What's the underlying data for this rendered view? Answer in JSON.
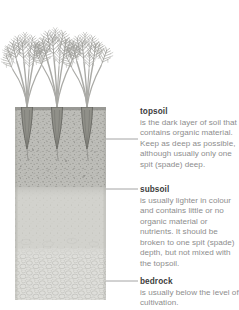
{
  "figure": {
    "plants": {
      "name": "carrot-plants",
      "count": 3,
      "root_positions": [
        27,
        57,
        87
      ]
    },
    "colors": {
      "topsoil": "#b9b9b5",
      "subsoil": "#cfcfca",
      "bedrock": "#dcdcd8",
      "outline": "#8b8b86",
      "foliage": "#9a9a96",
      "stem": "#a8a8a4",
      "root": "#6f6f6b",
      "leader_line": "#9a9a9a",
      "heading_text": "#3d3d3d",
      "body_text": "#8d8d8d",
      "background": "#ffffff"
    },
    "column": {
      "left": 15,
      "right": 106,
      "top": 107,
      "bottom": 300,
      "layers": [
        {
          "name": "topsoil",
          "top": 107,
          "bottom": 185
        },
        {
          "name": "subsoil",
          "top": 185,
          "bottom": 246
        },
        {
          "name": "bedrock",
          "top": 246,
          "bottom": 300
        }
      ]
    }
  },
  "annotations": [
    {
      "id": "topsoil",
      "title": "topsoil",
      "body": "is the dark layer of soil that contains organic material. Keep as deep as possible, although usually only one spit (spade) deep.",
      "leader": {
        "x1": 106,
        "x2": 138,
        "y": 139
      }
    },
    {
      "id": "subsoil",
      "title": "subsoil",
      "body": "is usually lighter in colour and contains little or no organic material or nutrients. It should be broken to one spit (spade) depth, but not mixed with the topsoil.",
      "leader": {
        "x1": 106,
        "x2": 138,
        "y": 189
      }
    },
    {
      "id": "bedrock",
      "title": "bedrock",
      "body": "is usually below the level of cultivation.",
      "leader": {
        "x1": 106,
        "x2": 138,
        "y": 281
      }
    }
  ]
}
